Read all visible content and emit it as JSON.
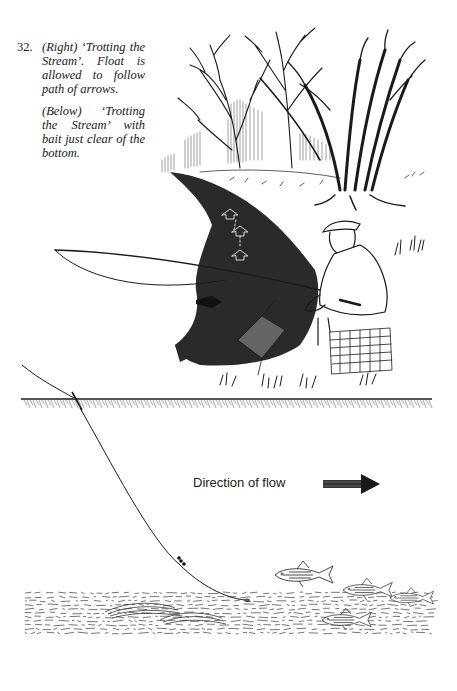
{
  "figure": {
    "number": "32.",
    "caption_right": "(Right) ‘Trotting the Stream’. Float is allowed to follow path of arrows.",
    "caption_below": "(Below) ‘Trotting the Stream’ with bait just clear of the bottom."
  },
  "top_illustration": {
    "subject": "angler seated on wicker basket by stream, trotting a float downstream",
    "elements": [
      "bare-trees",
      "fence",
      "grassy-bank",
      "dark-stream",
      "float-path-arrows",
      "fishing-rod",
      "landing-net",
      "angler",
      "wicker-basket"
    ]
  },
  "bottom_diagram": {
    "flow_label": "Direction of flow",
    "flow_direction": "right",
    "elements": [
      "water-surface",
      "fishing-line",
      "float",
      "split-shot",
      "baited-hook",
      "river-bed",
      "weed",
      "fish"
    ],
    "fish_count": 4
  },
  "colors": {
    "ink": "#1a1a1a",
    "paper": "#ffffff"
  }
}
